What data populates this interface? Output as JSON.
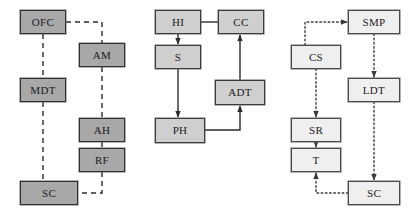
{
  "diagram": {
    "type": "flow-diagram",
    "width": 418,
    "height": 217,
    "background": "#ffffff",
    "palette": {
      "dark_fill": "#a8a8a8",
      "mid_fill": "#cfcfcf",
      "light_fill": "#efefef",
      "border": "#3a3a3a",
      "line": "#2b2b2b"
    },
    "panels": [
      {
        "id": "left",
        "line_style": "dashed",
        "arrowheads": false,
        "fill": "dark",
        "nodes": [
          {
            "id": "ofc",
            "label": "OFC",
            "x": 20,
            "y": 10,
            "w": 46,
            "h": 24
          },
          {
            "id": "am",
            "label": "AM",
            "x": 79,
            "y": 43,
            "w": 46,
            "h": 24
          },
          {
            "id": "mdt",
            "label": "MDT",
            "x": 20,
            "y": 78,
            "w": 46,
            "h": 24
          },
          {
            "id": "ah",
            "label": "AH",
            "x": 79,
            "y": 118,
            "w": 46,
            "h": 24
          },
          {
            "id": "rf",
            "label": "RF",
            "x": 79,
            "y": 148,
            "w": 46,
            "h": 24
          },
          {
            "id": "sc_l",
            "label": "SC",
            "x": 20,
            "y": 181,
            "w": 58,
            "h": 24
          }
        ],
        "edges": [
          {
            "from": "ofc",
            "to": "am",
            "style": "dashed",
            "arrow": "none"
          },
          {
            "from": "ofc",
            "to": "mdt",
            "style": "dashed",
            "arrow": "none"
          },
          {
            "from": "mdt",
            "to": "sc_l",
            "style": "dashed",
            "arrow": "none"
          },
          {
            "from": "am",
            "to": "ah",
            "style": "dashed",
            "arrow": "none"
          },
          {
            "from": "ah",
            "to": "rf",
            "style": "dashed",
            "arrow": "none"
          },
          {
            "from": "rf",
            "to": "sc_l",
            "style": "dashed",
            "arrow": "none"
          }
        ]
      },
      {
        "id": "middle",
        "line_style": "solid",
        "arrowheads": true,
        "fill": "mid",
        "nodes": [
          {
            "id": "hi",
            "label": "HI",
            "x": 155,
            "y": 10,
            "w": 46,
            "h": 24
          },
          {
            "id": "cc",
            "label": "CC",
            "x": 218,
            "y": 10,
            "w": 46,
            "h": 24
          },
          {
            "id": "s",
            "label": "S",
            "x": 155,
            "y": 45,
            "w": 46,
            "h": 24
          },
          {
            "id": "adt",
            "label": "ADT",
            "x": 215,
            "y": 80,
            "w": 50,
            "h": 25
          },
          {
            "id": "ph",
            "label": "PH",
            "x": 155,
            "y": 118,
            "w": 50,
            "h": 25
          }
        ],
        "edges": [
          {
            "from": "hi",
            "to": "cc",
            "style": "solid",
            "arrow": "none"
          },
          {
            "from": "hi",
            "to": "s",
            "style": "solid",
            "arrow": "target"
          },
          {
            "from": "s",
            "to": "ph",
            "style": "solid",
            "arrow": "target"
          },
          {
            "from": "ph",
            "to": "adt",
            "style": "solid",
            "arrow": "target"
          },
          {
            "from": "adt",
            "to": "cc",
            "style": "solid",
            "arrow": "target"
          }
        ]
      },
      {
        "id": "right",
        "line_style": "dotted",
        "arrowheads": true,
        "fill": "light",
        "nodes": [
          {
            "id": "smp",
            "label": "SMP",
            "x": 348,
            "y": 10,
            "w": 52,
            "h": 24
          },
          {
            "id": "cs",
            "label": "CS",
            "x": 291,
            "y": 45,
            "w": 50,
            "h": 24
          },
          {
            "id": "ldt",
            "label": "LDT",
            "x": 348,
            "y": 78,
            "w": 52,
            "h": 24
          },
          {
            "id": "sr",
            "label": "SR",
            "x": 291,
            "y": 118,
            "w": 50,
            "h": 24
          },
          {
            "id": "t",
            "label": "T",
            "x": 291,
            "y": 148,
            "w": 50,
            "h": 24
          },
          {
            "id": "sc_r",
            "label": "SC",
            "x": 348,
            "y": 181,
            "w": 52,
            "h": 24
          }
        ],
        "edges": [
          {
            "from": "cs",
            "to": "smp",
            "style": "dotted",
            "arrow": "target"
          },
          {
            "from": "smp",
            "to": "ldt",
            "style": "dotted",
            "arrow": "target"
          },
          {
            "from": "cs",
            "to": "sr",
            "style": "dotted",
            "arrow": "target"
          },
          {
            "from": "sr",
            "to": "t",
            "style": "dotted",
            "arrow": "target"
          },
          {
            "from": "ldt",
            "to": "sc_r",
            "style": "dotted",
            "arrow": "target"
          },
          {
            "from": "sc_r",
            "to": "t",
            "style": "dotted",
            "arrow": "target"
          }
        ]
      }
    ]
  }
}
